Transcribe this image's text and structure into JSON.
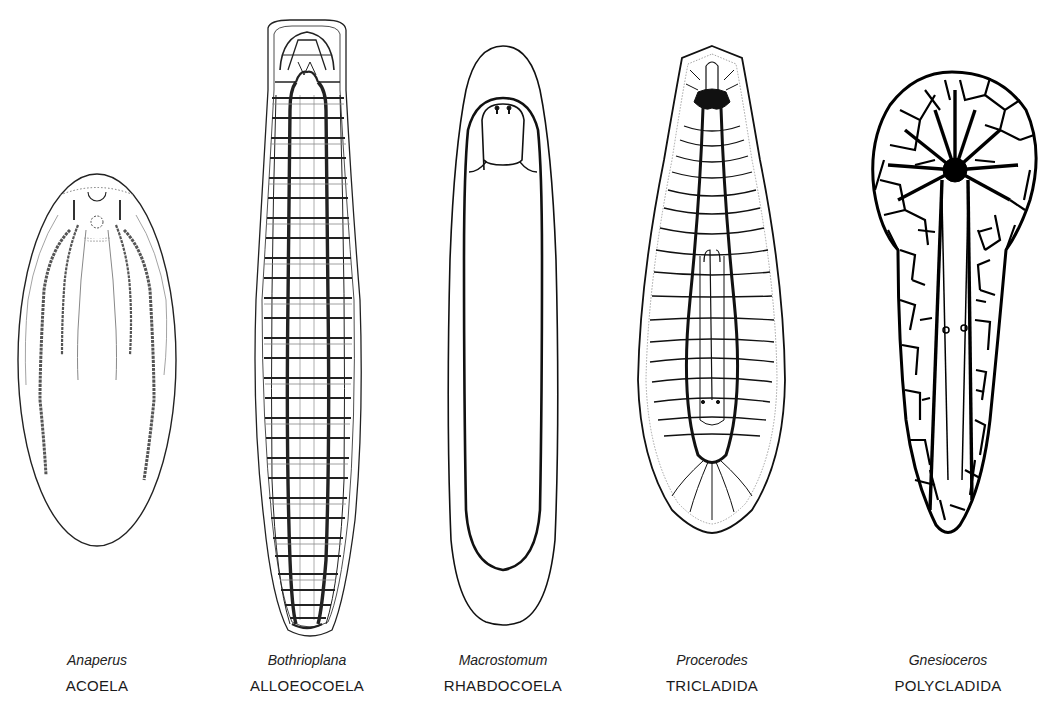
{
  "figure": {
    "specimens": [
      {
        "genus": "Anaperus",
        "order": "ACOELA",
        "center_x": 97
      },
      {
        "genus": "Bothrioplana",
        "order": "ALLOEOCOELA",
        "center_x": 307
      },
      {
        "genus": "Macrostomum",
        "order": "RHABDOCOELA",
        "center_x": 503
      },
      {
        "genus": "Procerodes",
        "order": "TRICLADIDA",
        "center_x": 712
      },
      {
        "genus": "Gnesioceros",
        "order": "POLYCLADIDA",
        "center_x": 948
      }
    ],
    "colors": {
      "ink": "#111111",
      "background": "#ffffff",
      "stipple": "#555555"
    }
  }
}
